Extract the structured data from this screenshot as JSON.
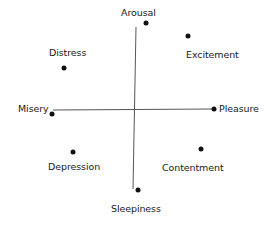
{
  "diagram": {
    "type": "circumplex-model-of-affect",
    "axes": {
      "vertical": {
        "top_label": "Arousal",
        "bottom_label": "Sleepiness"
      },
      "horizontal": {
        "left_label": "Misery",
        "right_label": "Pleasure"
      }
    },
    "colors": {
      "ink": "#111111",
      "axis": "#555555",
      "background": "#ffffff"
    },
    "nodes": [
      {
        "id": "arousal",
        "label": "Arousal",
        "dot": [
          146,
          23
        ],
        "label_pos": [
          121,
          8
        ]
      },
      {
        "id": "excitement",
        "label": "Excitement",
        "dot": [
          188,
          36
        ],
        "label_pos": [
          186,
          50
        ]
      },
      {
        "id": "distress",
        "label": "Distress",
        "dot": [
          64,
          68
        ],
        "label_pos": [
          49,
          48
        ]
      },
      {
        "id": "misery",
        "label": "Misery",
        "dot": [
          52,
          114
        ],
        "label_pos": [
          18,
          104
        ]
      },
      {
        "id": "pleasure",
        "label": "Pleasure",
        "dot": [
          214,
          109
        ],
        "label_pos": [
          219,
          104
        ]
      },
      {
        "id": "depression",
        "label": "Depression",
        "dot": [
          73,
          152
        ],
        "label_pos": [
          48,
          162
        ]
      },
      {
        "id": "contentment",
        "label": "Contentment",
        "dot": [
          201,
          149
        ],
        "label_pos": [
          162,
          163
        ]
      },
      {
        "id": "sleepiness",
        "label": "Sleepiness",
        "dot": [
          138,
          190
        ],
        "label_pos": [
          111,
          204
        ]
      }
    ]
  }
}
